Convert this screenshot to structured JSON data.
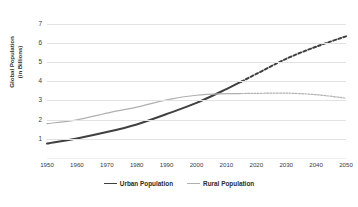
{
  "chart_data": {
    "type": "line",
    "title": "",
    "xlabel": "",
    "ylabel": "Global Population (in Billions)",
    "ylabel_line1": "Global Population",
    "ylabel_line2": "(in Billions)",
    "xlim": [
      1950,
      2050
    ],
    "ylim": [
      0,
      7.4
    ],
    "yticks": [
      7,
      6,
      5,
      4,
      3,
      2,
      1
    ],
    "xticks": [
      1950,
      1960,
      1970,
      1980,
      1990,
      2000,
      2010,
      2020,
      2030,
      2040,
      2050
    ],
    "grid": "horizontal",
    "legend_position": "bottom-center",
    "projection_starts": 2015,
    "annotations": [
      "Solid segments are historical data through 2015",
      "Dashed segments are projections from 2015 to 2050"
    ],
    "series": [
      {
        "name": "Urban Population",
        "color": "#404040",
        "width": 2.0,
        "x": [
          1950,
          1960,
          1970,
          1980,
          1990,
          2000,
          2010,
          2015,
          2020,
          2030,
          2040,
          2050
        ],
        "values": [
          0.75,
          1.02,
          1.35,
          1.75,
          2.29,
          2.87,
          3.59,
          3.98,
          4.38,
          5.17,
          5.8,
          6.34
        ]
      },
      {
        "name": "Rural Population",
        "color": "#b0b0b0",
        "width": 1.2,
        "x": [
          1950,
          1960,
          1970,
          1980,
          1990,
          2000,
          2010,
          2015,
          2020,
          2030,
          2040,
          2050
        ],
        "values": [
          1.79,
          1.99,
          2.34,
          2.65,
          3.03,
          3.27,
          3.35,
          3.36,
          3.37,
          3.38,
          3.3,
          3.12
        ]
      }
    ]
  },
  "axis": {
    "y_title_line1": "Global Population",
    "y_title_line2": "(in Billions)",
    "y_tick_labels": [
      "7",
      "6",
      "5",
      "4",
      "3",
      "2",
      "1"
    ],
    "x_tick_labels": [
      "1950",
      "1960",
      "1970",
      "1980",
      "1990",
      "2000",
      "2010",
      "2020",
      "2030",
      "2040",
      "2050"
    ]
  },
  "legend": {
    "items": [
      {
        "label": "Urban Population",
        "style": "urban"
      },
      {
        "label": "Rural Population",
        "style": "rural"
      }
    ]
  },
  "colors": {
    "urban": "#404040",
    "rural": "#b0b0b0",
    "gridline": "#e2e2e2",
    "text": "#3a3a3a",
    "background": "#ffffff"
  }
}
